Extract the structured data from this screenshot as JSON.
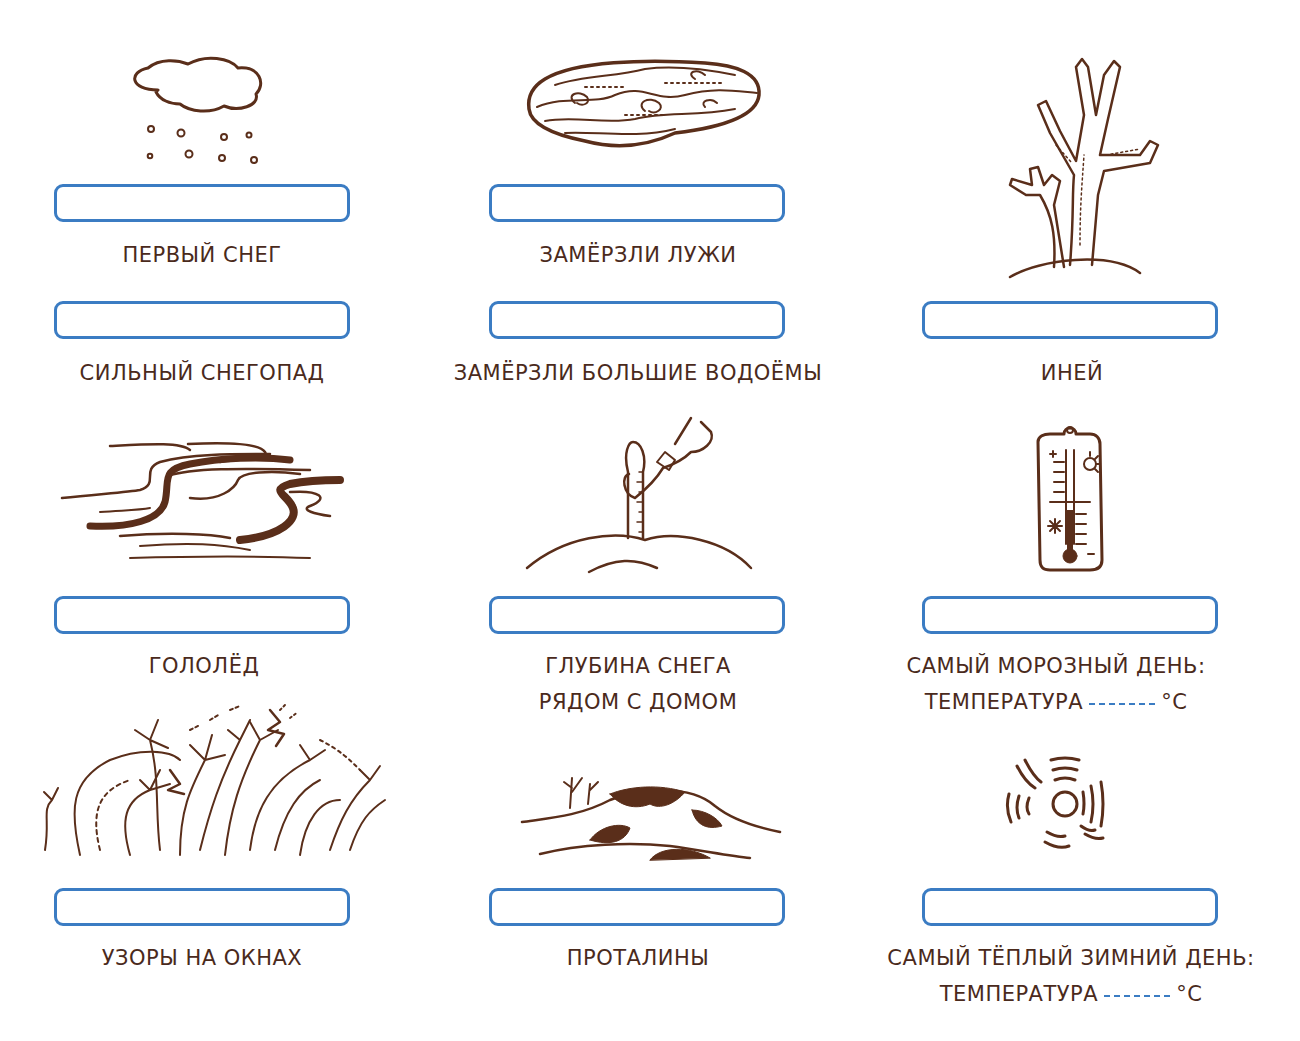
{
  "worksheet": {
    "header_fragment": "",
    "items": [
      {
        "id": "first-snow",
        "label": "ПЕРВЫЙ СНЕГ",
        "illustration": "snow-cloud-icon",
        "answer": ""
      },
      {
        "id": "heavy-snowfall",
        "label": "СИЛЬНЫЙ СНЕГОПАД",
        "illustration": "",
        "answer": ""
      },
      {
        "id": "puddles-frozen",
        "label": "ЗАМЁРЗЛИ ЛУЖИ",
        "illustration": "frozen-puddle-icon",
        "answer": ""
      },
      {
        "id": "large-ponds-frozen",
        "label": "ЗАМЁРЗЛИ БОЛЬШИЕ ВОДОЁМЫ",
        "illustration": "",
        "answer": ""
      },
      {
        "id": "hoarfrost",
        "label": "ИНЕЙ",
        "illustration": "frosted-tree-icon",
        "answer": ""
      },
      {
        "id": "black-ice",
        "label": "ГОЛОЛЁД",
        "illustration": "ice-swirl-icon",
        "answer": ""
      },
      {
        "id": "snow-depth",
        "label_line1": "ГЛУБИНА СНЕГА",
        "label_line2": "РЯДОМ С ДОМОМ",
        "illustration": "ruler-in-snow-icon",
        "answer": ""
      },
      {
        "id": "coldest-day",
        "label_line1": "САМЫЙ МОРОЗНЫЙ ДЕНЬ:",
        "label_line2_prefix": "ТЕМПЕРАТУРА",
        "unit": "°C",
        "temperature": "",
        "illustration": "thermometer-icon",
        "answer": ""
      },
      {
        "id": "frost-patterns",
        "label": "УЗОРЫ НА ОКНАХ",
        "illustration": "frost-pattern-icon",
        "answer": ""
      },
      {
        "id": "thawed-patches",
        "label": "ПРОТАЛИНЫ",
        "illustration": "thawed-hill-icon",
        "answer": ""
      },
      {
        "id": "warmest-day",
        "label_line1": "САМЫЙ ТЁПЛЫЙ ЗИМНИЙ ДЕНЬ:",
        "label_line2_prefix": "ТЕМПЕРАТУРА",
        "unit": "°C",
        "temperature": "",
        "illustration": "sun-icon",
        "answer": ""
      }
    ]
  },
  "colors": {
    "box_border": "#3b7cc3",
    "text": "#4a2a1c",
    "ink": "#5a2e1a"
  }
}
